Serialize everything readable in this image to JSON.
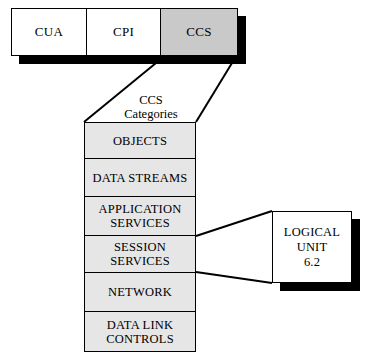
{
  "diagram": {
    "background_color": "#ffffff",
    "line_color": "#000000",
    "shadow_color": "#000000",
    "top_bar": {
      "boxes": [
        {
          "label": "CUA",
          "filled": false,
          "fill_color": "#ffffff"
        },
        {
          "label": "CPI",
          "filled": false,
          "fill_color": "#ffffff"
        },
        {
          "label": "CCS",
          "filled": true,
          "fill_color": "#c9c9c9"
        }
      ]
    },
    "caption": {
      "line1": "CCS",
      "line2": "Categories"
    },
    "stack": {
      "fill_color": "#e6e6e6",
      "rows": [
        {
          "line1": "OBJECTS",
          "line2": ""
        },
        {
          "line1": "DATA STREAMS",
          "line2": ""
        },
        {
          "line1": "APPLICATION",
          "line2": "SERVICES"
        },
        {
          "line1": "SESSION",
          "line2": "SERVICES"
        },
        {
          "line1": "NETWORK",
          "line2": ""
        },
        {
          "line1": "DATA LINK",
          "line2": "CONTROLS"
        }
      ]
    },
    "callout": {
      "line1": "LOGICAL",
      "line2": "UNIT",
      "line3": "6.2",
      "fill_color": "#ffffff"
    }
  }
}
